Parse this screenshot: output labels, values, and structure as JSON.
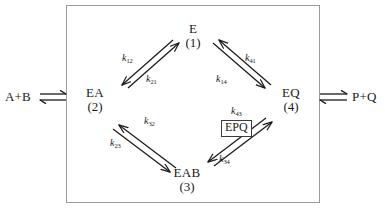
{
  "diagram": {
    "frame_border_color": "#9a9a9a",
    "ink_color": "#1a1a1a"
  },
  "substrate_label": "A+B",
  "product_label": "P+Q",
  "entry_arrow": "double-harpoon-right",
  "exit_arrow": "double-harpoon-right",
  "nodes": [
    {
      "id": "E",
      "species": "E",
      "index": "(1)"
    },
    {
      "id": "EA",
      "species": "EA",
      "index": "(2)"
    },
    {
      "id": "EAB",
      "species": "EAB",
      "index": "(3)"
    },
    {
      "id": "EQ",
      "species": "EQ",
      "index": "(4)"
    }
  ],
  "intermediate": {
    "species": "EPQ"
  },
  "rate_constants": [
    {
      "id": "k12",
      "base": "k",
      "sub": "12",
      "from": "E",
      "to": "EA"
    },
    {
      "id": "k21",
      "base": "k",
      "sub": "21",
      "from": "EA",
      "to": "E"
    },
    {
      "id": "k23",
      "base": "k",
      "sub": "23",
      "from": "EA",
      "to": "EAB"
    },
    {
      "id": "k32",
      "base": "k",
      "sub": "32",
      "from": "EAB",
      "to": "EA"
    },
    {
      "id": "k34",
      "base": "k",
      "sub": "34",
      "from": "EAB",
      "to": "EQ"
    },
    {
      "id": "k43",
      "base": "k",
      "sub": "43",
      "from": "EQ",
      "to": "EAB"
    },
    {
      "id": "k41",
      "base": "k",
      "sub": "41",
      "from": "EQ",
      "to": "E"
    },
    {
      "id": "k14",
      "base": "k",
      "sub": "14",
      "from": "E",
      "to": "EQ"
    }
  ]
}
